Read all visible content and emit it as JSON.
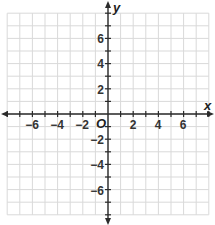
{
  "diagram": {
    "type": "coordinate-plane",
    "x_axis": {
      "label": "x",
      "min": -8,
      "max": 8,
      "tick_step": 1,
      "labeled_ticks": [
        -6,
        -4,
        -2,
        2,
        4,
        6
      ]
    },
    "y_axis": {
      "label": "y",
      "min": -8,
      "max": 8,
      "tick_step": 1,
      "labeled_ticks": [
        6,
        4,
        2,
        -2,
        -4,
        -6
      ]
    },
    "origin_label": "O",
    "grid": true,
    "colors": {
      "grid": "#d9d9d9",
      "axis": "#2b2b2b",
      "labels": "#333333"
    }
  },
  "labels": {
    "x": "x",
    "y": "y",
    "origin": "O",
    "x_ticks": [
      "−6",
      "−4",
      "−2",
      "2",
      "4",
      "6"
    ],
    "y_ticks": [
      "6",
      "4",
      "2",
      "−2",
      "−4",
      "−6"
    ]
  }
}
